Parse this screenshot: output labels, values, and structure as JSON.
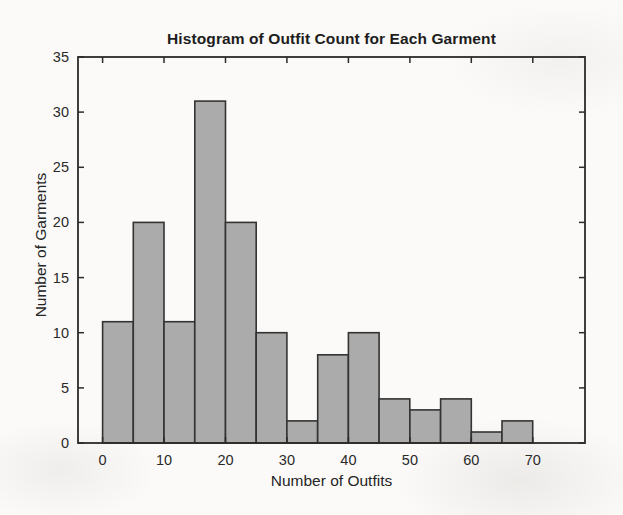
{
  "chart_data": {
    "type": "bar",
    "subtype": "histogram",
    "title": "Histogram of Outfit Count for Each Garment",
    "xlabel": "Number of Outfits",
    "ylabel": "Number of Garments",
    "bin_width": 5,
    "bin_edges": [
      0,
      5,
      10,
      15,
      20,
      25,
      30,
      35,
      40,
      45,
      50,
      55,
      60,
      65,
      70
    ],
    "values": [
      11,
      20,
      11,
      31,
      20,
      10,
      2,
      8,
      10,
      4,
      3,
      4,
      1,
      2
    ],
    "xticks": [
      0,
      10,
      20,
      30,
      40,
      50,
      60,
      70
    ],
    "yticks": [
      0,
      5,
      10,
      15,
      20,
      25,
      30,
      35
    ],
    "xlim": [
      -4,
      78.5
    ],
    "ylim": [
      0,
      35
    ],
    "grid": false,
    "legend_position": "none",
    "tick_direction": "in",
    "colors": {
      "bar_fill": "#ababab",
      "bar_edge": "#333333",
      "axis": "#2b2b2b",
      "tick_text": "#2a2a2a"
    }
  }
}
